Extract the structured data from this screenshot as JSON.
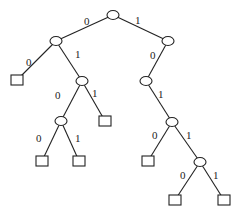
{
  "diagram": {
    "type": "binary-tree",
    "nodes": [
      {
        "id": "n0",
        "kind": "internal",
        "x": 113,
        "y": 15
      },
      {
        "id": "n1",
        "kind": "internal",
        "x": 56,
        "y": 41
      },
      {
        "id": "n2",
        "kind": "internal",
        "x": 168,
        "y": 41
      },
      {
        "id": "l0",
        "kind": "leaf",
        "x": 17,
        "y": 80
      },
      {
        "id": "n3",
        "kind": "internal",
        "x": 82,
        "y": 81
      },
      {
        "id": "n4",
        "kind": "internal",
        "x": 146,
        "y": 81
      },
      {
        "id": "n5",
        "kind": "internal",
        "x": 61,
        "y": 121
      },
      {
        "id": "l1",
        "kind": "leaf",
        "x": 105,
        "y": 121
      },
      {
        "id": "n6",
        "kind": "internal",
        "x": 172,
        "y": 122
      },
      {
        "id": "l2",
        "kind": "leaf",
        "x": 42,
        "y": 161
      },
      {
        "id": "l3",
        "kind": "leaf",
        "x": 79,
        "y": 161
      },
      {
        "id": "l4",
        "kind": "leaf",
        "x": 148,
        "y": 161
      },
      {
        "id": "n7",
        "kind": "internal",
        "x": 200,
        "y": 162
      },
      {
        "id": "l5",
        "kind": "leaf",
        "x": 175,
        "y": 200
      },
      {
        "id": "l6",
        "kind": "leaf",
        "x": 224,
        "y": 200
      }
    ],
    "edges": [
      {
        "from": "n0",
        "to": "n1",
        "label": "0",
        "lx": 84,
        "ly": 25
      },
      {
        "from": "n0",
        "to": "n2",
        "label": "1",
        "lx": 135,
        "ly": 24
      },
      {
        "from": "n1",
        "to": "l0",
        "label": "0",
        "lx": 26,
        "ly": 66
      },
      {
        "from": "n1",
        "to": "n3",
        "label": "1",
        "lx": 75,
        "ly": 58
      },
      {
        "from": "n2",
        "to": "n4",
        "label": "0",
        "lx": 150,
        "ly": 59
      },
      {
        "from": "n3",
        "to": "n5",
        "label": "0",
        "lx": 55,
        "ly": 99
      },
      {
        "from": "n3",
        "to": "l1",
        "label": "1",
        "lx": 92,
        "ly": 97
      },
      {
        "from": "n4",
        "to": "n6",
        "label": "1",
        "lx": 158,
        "ly": 98
      },
      {
        "from": "n5",
        "to": "l2",
        "label": "0",
        "lx": 36,
        "ly": 142
      },
      {
        "from": "n5",
        "to": "l3",
        "label": "1",
        "lx": 75,
        "ly": 142
      },
      {
        "from": "n6",
        "to": "l4",
        "label": "0",
        "lx": 152,
        "ly": 139
      },
      {
        "from": "n6",
        "to": "n7",
        "label": "1",
        "lx": 186,
        "ly": 139
      },
      {
        "from": "n7",
        "to": "l5",
        "label": "0",
        "lx": 180,
        "ly": 179
      },
      {
        "from": "n7",
        "to": "l6",
        "label": "1",
        "lx": 213,
        "ly": 179
      }
    ]
  }
}
